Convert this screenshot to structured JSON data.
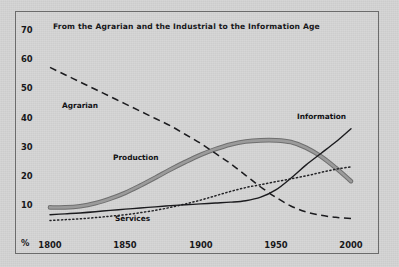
{
  "chart_data": {
    "type": "line",
    "title": "From the Agrarian and the Industrial to the Information Age",
    "xlabel": "",
    "ylabel": "%",
    "xlim": [
      1795,
      2005
    ],
    "ylim": [
      0,
      72
    ],
    "grid": false,
    "legend_position": "inline-annotations",
    "xticks": [
      "1800",
      "1850",
      "1900",
      "1950",
      "2000"
    ],
    "xtick_values": [
      1800,
      1850,
      1900,
      1950,
      2000
    ],
    "yticks": [
      "10",
      "20",
      "30",
      "40",
      "50",
      "60",
      "70"
    ],
    "ytick_values": [
      10,
      20,
      30,
      40,
      50,
      60,
      70
    ],
    "x": [
      1800,
      1810,
      1820,
      1830,
      1840,
      1850,
      1860,
      1870,
      1880,
      1890,
      1900,
      1910,
      1920,
      1930,
      1940,
      1950,
      1960,
      1970,
      1980,
      1990,
      2000
    ],
    "series": [
      {
        "name": "Agrarian",
        "style": "dashed",
        "color": "#1b1b1e",
        "values": [
          57,
          54.5,
          52,
          49.5,
          47,
          44.5,
          42,
          39.5,
          37,
          34,
          31,
          27.5,
          24,
          20,
          16,
          12.5,
          9.5,
          7.5,
          6.3,
          5.6,
          5.2
        ]
      },
      {
        "name": "Production",
        "style": "thick-gray",
        "color": "#8a8a8a",
        "values": [
          9,
          9,
          9.4,
          10.4,
          12,
          14,
          16.5,
          19.2,
          22,
          24.6,
          27,
          29,
          30.6,
          31.6,
          32,
          32,
          31.4,
          29.5,
          26.5,
          22.5,
          18
        ]
      },
      {
        "name": "Services",
        "style": "dotted",
        "color": "#232326",
        "values": [
          4.5,
          4.8,
          5.1,
          5.5,
          6,
          6.5,
          7.2,
          8,
          9,
          10.2,
          11.5,
          13,
          14.5,
          15.8,
          16.8,
          17.8,
          18.8,
          19.8,
          21,
          22.1,
          22.9
        ]
      },
      {
        "name": "Information",
        "style": "solid",
        "color": "#1b1b1e",
        "values": [
          6.5,
          6.8,
          7.1,
          7.5,
          8,
          8.4,
          8.8,
          9.2,
          9.6,
          9.9,
          10.2,
          10.5,
          10.8,
          11.3,
          12.5,
          15,
          19,
          23.5,
          27.5,
          31.5,
          36
        ]
      }
    ],
    "annotations": [
      {
        "text": "Agrarian",
        "x": 1820,
        "y": 41
      },
      {
        "text": "Production",
        "x": 1852,
        "y": 25
      },
      {
        "text": "Services",
        "x": 1855,
        "y": 3.3
      },
      {
        "text": "Information",
        "x": 1972,
        "y": 39
      }
    ]
  }
}
